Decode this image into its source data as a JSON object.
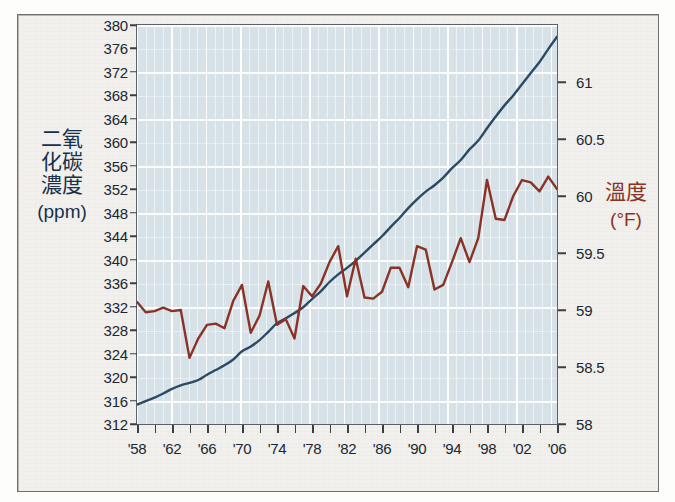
{
  "axes": {
    "left_title_cjk": "二氧化碳濃度",
    "left_title_unit": "(ppm)",
    "right_title_cjk": "溫度",
    "right_title_unit": "(°F)",
    "left_color": "#16304d",
    "right_color": "#8a3225",
    "left_ticks": [
      "380",
      "376",
      "372",
      "368",
      "364",
      "360",
      "356",
      "352",
      "348",
      "344",
      "340",
      "336",
      "332",
      "328",
      "324",
      "320",
      "316",
      "312"
    ],
    "right_ticks": [
      "61",
      "60.5",
      "60",
      "59.5",
      "59",
      "58.5",
      "58"
    ],
    "x_ticks": [
      "'58",
      "'62",
      "'66",
      "'70",
      "'74",
      "'78",
      "'82",
      "'86",
      "'90",
      "'94",
      "'98",
      "'02",
      "'06"
    ]
  },
  "chart_data": {
    "type": "line",
    "title": "",
    "xlabel": "",
    "ylabel": "二氧化碳濃度 (ppm)",
    "y2label": "溫度 (°F)",
    "ylim": [
      312,
      380
    ],
    "y2lim": [
      58,
      61.5
    ],
    "xlim": [
      1958,
      2006
    ],
    "grid": true,
    "legend": "none",
    "x": [
      1958,
      1959,
      1960,
      1961,
      1962,
      1963,
      1964,
      1965,
      1966,
      1967,
      1968,
      1969,
      1970,
      1971,
      1972,
      1973,
      1974,
      1975,
      1976,
      1977,
      1978,
      1979,
      1980,
      1981,
      1982,
      1983,
      1984,
      1985,
      1986,
      1987,
      1988,
      1989,
      1990,
      1991,
      1992,
      1993,
      1994,
      1995,
      1996,
      1997,
      1998,
      1999,
      2000,
      2001,
      2002,
      2003,
      2004,
      2005,
      2006
    ],
    "series": [
      {
        "name": "二氧化碳濃度 (ppm)",
        "axis": "left",
        "color": "#2b4a63",
        "units": "ppm",
        "values": [
          315.3,
          315.9,
          316.5,
          317.2,
          318.0,
          318.6,
          319.0,
          319.5,
          320.4,
          321.2,
          322.0,
          323.0,
          324.4,
          325.2,
          326.3,
          327.7,
          329.2,
          330.0,
          330.9,
          331.9,
          333.3,
          334.6,
          336.2,
          337.5,
          338.6,
          339.8,
          341.2,
          342.6,
          344.0,
          345.6,
          347.1,
          348.8,
          350.3,
          351.6,
          352.7,
          354.0,
          355.6,
          357.0,
          358.8,
          360.3,
          362.4,
          364.4,
          366.3,
          368.0,
          369.9,
          371.8,
          373.7,
          375.9,
          378.0
        ]
      },
      {
        "name": "溫度 (°F)",
        "axis": "right",
        "color": "#8a3225",
        "units": "°F",
        "values": [
          59.07,
          58.98,
          58.99,
          59.02,
          58.99,
          59.0,
          58.58,
          58.75,
          58.87,
          58.88,
          58.84,
          59.08,
          59.22,
          58.8,
          58.95,
          59.25,
          58.87,
          58.92,
          58.75,
          59.21,
          59.12,
          59.23,
          59.42,
          59.56,
          59.12,
          59.45,
          59.11,
          59.1,
          59.16,
          59.37,
          59.37,
          59.2,
          59.56,
          59.53,
          59.18,
          59.22,
          59.42,
          59.63,
          59.42,
          59.63,
          60.14,
          59.8,
          59.79,
          60.0,
          60.14,
          60.12,
          60.04,
          60.17,
          60.06
        ]
      }
    ]
  }
}
